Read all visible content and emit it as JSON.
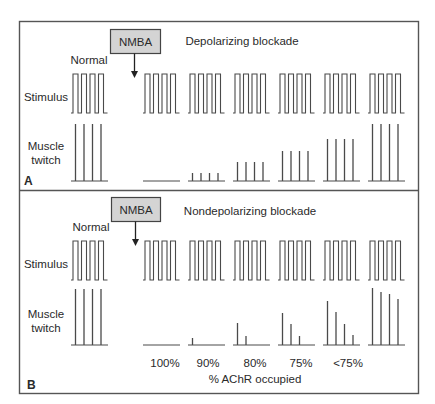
{
  "figure": {
    "colors": {
      "border": "#555555",
      "line": "#4a4a4a",
      "nmba_fill": "#d4d4d4",
      "text": "#2a2a2a"
    },
    "panels": [
      {
        "id": "A",
        "letter": "A",
        "title": "Depolarizing blockade",
        "nmba_label": "NMBA",
        "normal_label": "Normal",
        "stimulus_label": "Stimulus",
        "twitch_label_line1": "Muscle",
        "twitch_label_line2": "twitch",
        "groups": [
          {
            "name": "normal",
            "twitch_heights": [
              57,
              57,
              57,
              57
            ]
          },
          {
            "name": "block-1",
            "twitch_heights": [
              0,
              0,
              0,
              0
            ]
          },
          {
            "name": "block-2",
            "twitch_heights": [
              8,
              8,
              8,
              8
            ]
          },
          {
            "name": "block-3",
            "twitch_heights": [
              19,
              19,
              19,
              19
            ]
          },
          {
            "name": "block-4",
            "twitch_heights": [
              30,
              30,
              30,
              30
            ]
          },
          {
            "name": "block-5",
            "twitch_heights": [
              42,
              42,
              42,
              42
            ]
          },
          {
            "name": "block-6",
            "twitch_heights": [
              57,
              57,
              57,
              57
            ]
          }
        ],
        "occupancy_labels": []
      },
      {
        "id": "B",
        "letter": "B",
        "title": "Nondepolarizing blockade",
        "nmba_label": "NMBA",
        "normal_label": "Normal",
        "stimulus_label": "Stimulus",
        "twitch_label_line1": "Muscle",
        "twitch_label_line2": "twitch",
        "groups": [
          {
            "name": "normal",
            "twitch_heights": [
              56,
              56,
              56,
              56
            ]
          },
          {
            "name": "100%",
            "twitch_heights": [
              0,
              0,
              0,
              0
            ]
          },
          {
            "name": "90%",
            "twitch_heights": [
              7,
              0,
              0,
              0
            ]
          },
          {
            "name": "80%",
            "twitch_heights": [
              22,
              9,
              0,
              0
            ]
          },
          {
            "name": "75%",
            "twitch_heights": [
              32,
              21,
              9,
              0
            ]
          },
          {
            "name": "<75%",
            "twitch_heights": [
              44,
              33,
              21,
              10
            ]
          },
          {
            "name": "recovered",
            "twitch_heights": [
              57,
              53,
              51,
              46
            ]
          }
        ],
        "occupancy_labels": [
          "100%",
          "90%",
          "80%",
          "75%",
          "<75%"
        ],
        "occupancy_axis_label": "% AChR occupied"
      }
    ]
  }
}
